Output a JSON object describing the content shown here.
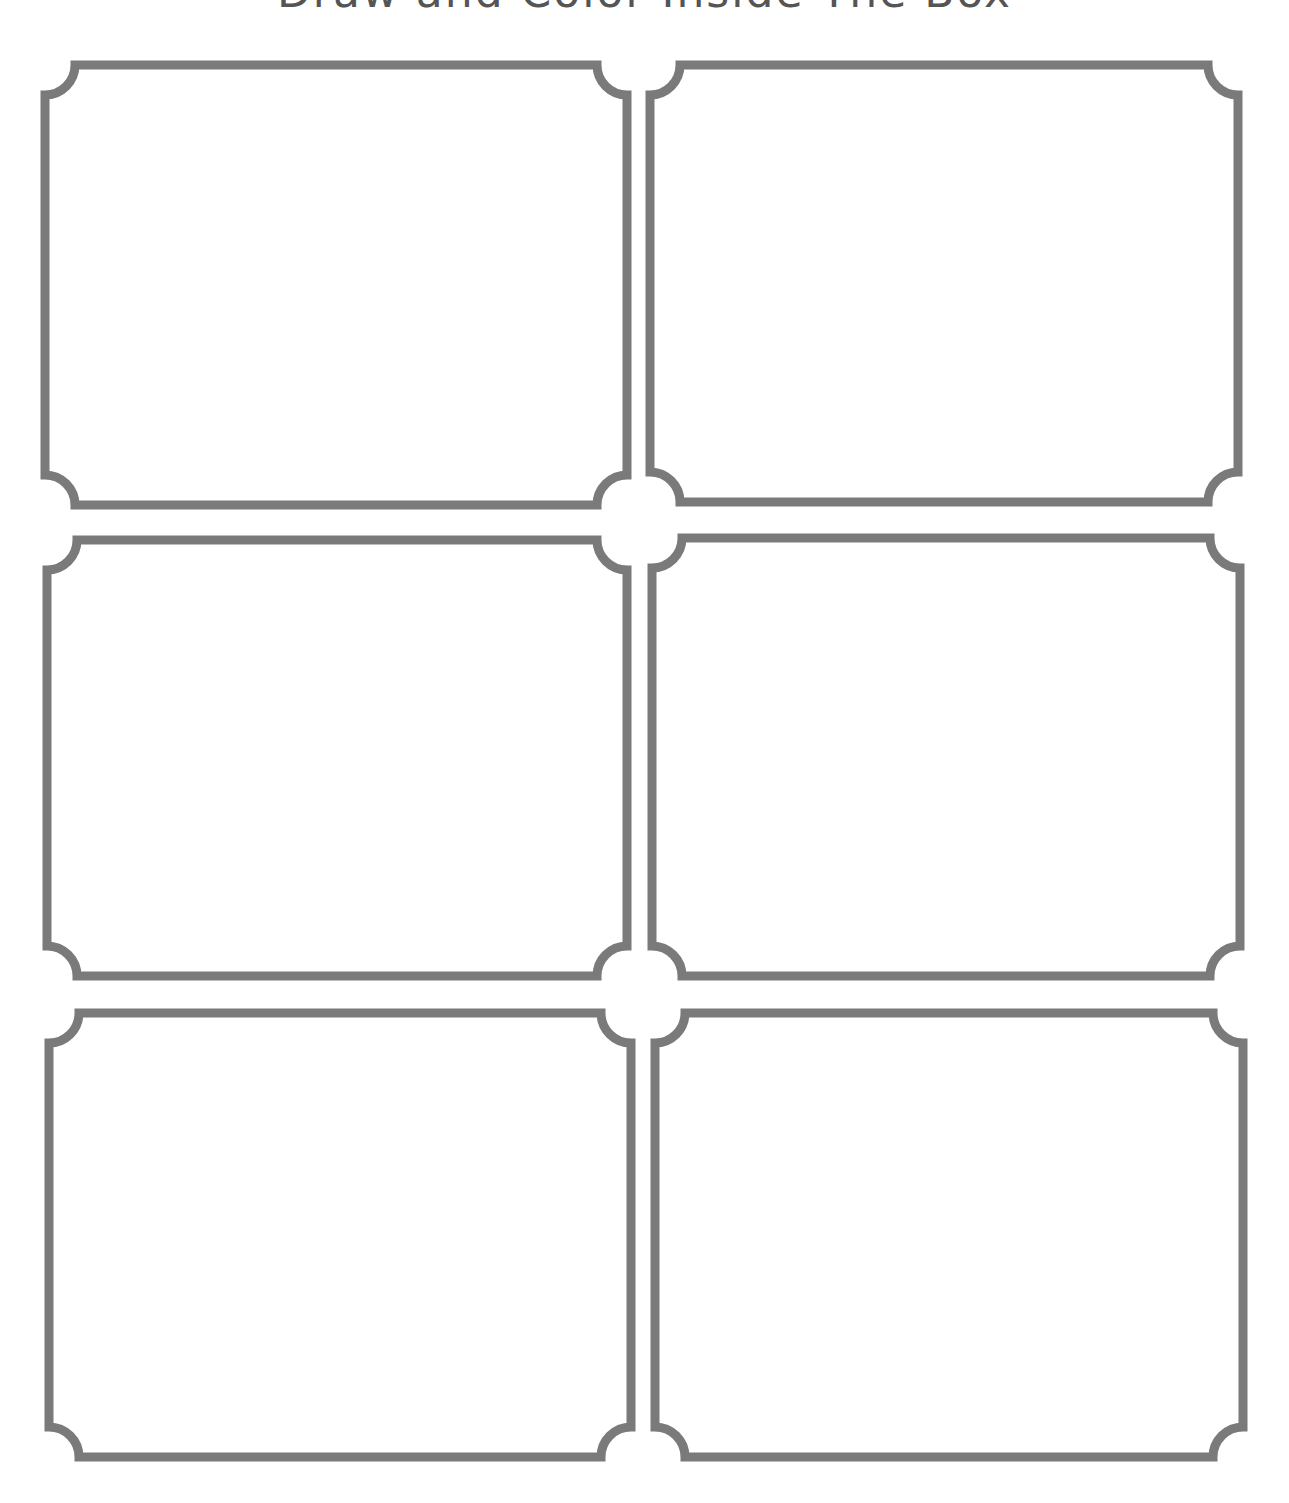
{
  "page": {
    "title": "Draw and Color Inside The Box",
    "background": "#ffffff",
    "frame_color": "#7a7a7a"
  },
  "frames": [
    {
      "id": "frame-1",
      "row": 1,
      "col": 1,
      "label": ""
    },
    {
      "id": "frame-2",
      "row": 1,
      "col": 2,
      "label": ""
    },
    {
      "id": "frame-3",
      "row": 2,
      "col": 1,
      "label": ""
    },
    {
      "id": "frame-4",
      "row": 2,
      "col": 2,
      "label": ""
    },
    {
      "id": "frame-5",
      "row": 3,
      "col": 1,
      "label": ""
    },
    {
      "id": "frame-6",
      "row": 3,
      "col": 2,
      "label": ""
    }
  ]
}
